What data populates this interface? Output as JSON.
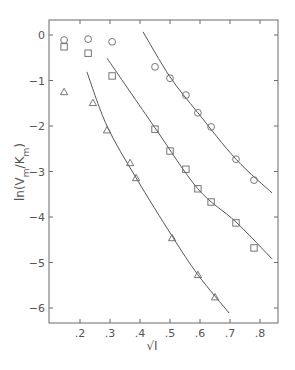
{
  "chart_data": {
    "type": "scatter",
    "title": "",
    "xlabel": "√I",
    "ylabel": "ln(Vm/Km)",
    "xlim": [
      0.097,
      0.86
    ],
    "ylim": [
      -6.3,
      0.33
    ],
    "x_ticks": [
      ".2",
      ".3",
      ".4",
      ".5",
      ".6",
      ".7",
      ".8"
    ],
    "x_tick_values": [
      0.2,
      0.3,
      0.4,
      0.5,
      0.6,
      0.7,
      0.8
    ],
    "y_ticks": [
      "0",
      "-1",
      "-2",
      "-3",
      "-4",
      "-5",
      "-6"
    ],
    "y_tick_values": [
      0,
      -1,
      -2,
      -3,
      -4,
      -5,
      -6
    ],
    "grid": false,
    "legend": null,
    "series": [
      {
        "name": "circles",
        "marker": "circle",
        "x": [
          0.147,
          0.227,
          0.307,
          0.45,
          0.5,
          0.553,
          0.593,
          0.637,
          0.72,
          0.78
        ],
        "y": [
          -0.11,
          -0.09,
          -0.15,
          -0.7,
          -0.95,
          -1.32,
          -1.71,
          -2.02,
          -2.73,
          -3.19
        ],
        "fit_curve": {
          "x": [
            0.41,
            0.5,
            0.593,
            0.72,
            0.84
          ],
          "y": [
            0.07,
            -0.92,
            -1.71,
            -2.73,
            -3.47
          ]
        }
      },
      {
        "name": "squares",
        "marker": "square",
        "x": [
          0.147,
          0.227,
          0.307,
          0.45,
          0.5,
          0.553,
          0.593,
          0.637,
          0.72,
          0.78
        ],
        "y": [
          -0.26,
          -0.4,
          -0.9,
          -2.07,
          -2.55,
          -2.95,
          -3.38,
          -3.67,
          -4.13,
          -4.68
        ],
        "fit_curve": {
          "x": [
            0.29,
            0.45,
            0.593,
            0.72,
            0.84
          ],
          "y": [
            -0.51,
            -2.04,
            -3.38,
            -4.11,
            -4.92
          ]
        }
      },
      {
        "name": "triangles",
        "marker": "triangle",
        "x": [
          0.147,
          0.243,
          0.29,
          0.367,
          0.387,
          0.507,
          0.593,
          0.65
        ],
        "y": [
          -1.25,
          -1.49,
          -2.09,
          -2.81,
          -3.14,
          -4.46,
          -5.27,
          -5.76
        ],
        "fit_curve": {
          "x": [
            0.223,
            0.29,
            0.387,
            0.507,
            0.593,
            0.697
          ],
          "y": [
            -0.81,
            -2.0,
            -3.14,
            -4.42,
            -5.27,
            -6.11
          ]
        }
      }
    ]
  },
  "axes": {
    "xlabel": "√I",
    "ylabel_main": "ln(V",
    "ylabel_sub1": "m",
    "ylabel_mid": "/K",
    "ylabel_sub2": "m",
    "ylabel_end": ")"
  }
}
